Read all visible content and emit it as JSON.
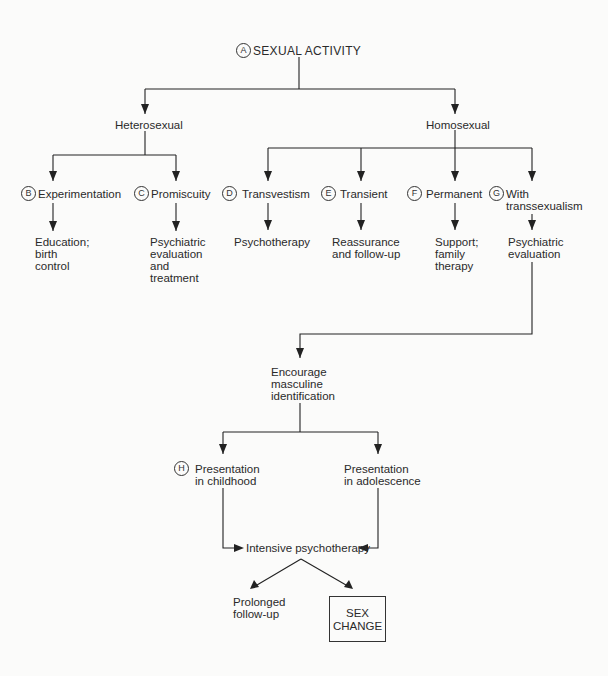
{
  "diagram": {
    "title": {
      "badge": "A",
      "label": "SEXUAL ACTIVITY"
    },
    "level1": {
      "heterosexual": "Heterosexual",
      "homosexual": "Homosexual"
    },
    "categories": [
      {
        "badge": "B",
        "label": "Experimentation",
        "action": [
          "Education;",
          "birth",
          "control"
        ]
      },
      {
        "badge": "C",
        "label": "Promiscuity",
        "action": [
          "Psychiatric",
          "evaluation",
          "and",
          "treatment"
        ]
      },
      {
        "badge": "D",
        "label": "Transvestism",
        "action": [
          "Psychotherapy"
        ]
      },
      {
        "badge": "E",
        "label": "Transient",
        "action": [
          "Reassurance",
          "and follow-up"
        ]
      },
      {
        "badge": "F",
        "label": "Permanent",
        "action": [
          "Support;",
          "family",
          "therapy"
        ]
      },
      {
        "badge": "G",
        "label": [
          "With",
          "transsexualism"
        ],
        "action": [
          "Psychiatric",
          "evaluation"
        ]
      }
    ],
    "encourage": [
      "Encourage",
      "masculine",
      "identification"
    ],
    "presentations": [
      {
        "badge": "H",
        "label": [
          "Presentation",
          "in childhood"
        ]
      },
      {
        "badge": "",
        "label": [
          "Presentation",
          "in adolescence"
        ]
      }
    ],
    "intensive": "Intensive psychotherapy",
    "outcomes": {
      "followup": [
        "Prolonged",
        "follow-up"
      ],
      "sex_change": [
        "SEX",
        "CHANGE"
      ]
    }
  }
}
